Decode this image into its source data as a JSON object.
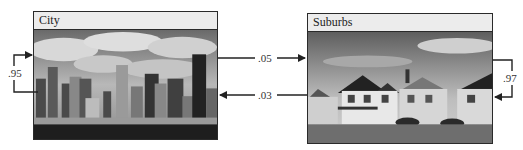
{
  "states": [
    {
      "id": "city",
      "label": "City",
      "image": "city-skyline-photo"
    },
    {
      "id": "suburbs",
      "label": "Suburbs",
      "image": "suburban-houses-photo"
    }
  ],
  "transitions": [
    {
      "from": "City",
      "to": "City",
      "probability": ".95"
    },
    {
      "from": "City",
      "to": "Suburbs",
      "probability": ".05"
    },
    {
      "from": "Suburbs",
      "to": "City",
      "probability": ".03"
    },
    {
      "from": "Suburbs",
      "to": "Suburbs",
      "probability": ".97"
    }
  ]
}
